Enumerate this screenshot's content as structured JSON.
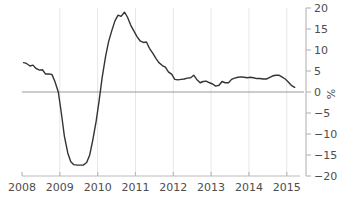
{
  "chart_data": {
    "type": "line",
    "title": "",
    "subtitle": "",
    "xlabel": "",
    "ylabel": "%",
    "xlim": [
      2008.0,
      2015.35
    ],
    "ylim": [
      -20,
      20
    ],
    "grid": "vertical-yearly",
    "legend": "none",
    "zero_line": true,
    "y_ticks": [
      20,
      15,
      10,
      5,
      0,
      -5,
      -10,
      -15,
      -20
    ],
    "y_tick_labels": [
      "20",
      "15",
      "10",
      "5",
      "0",
      "−5",
      "−10",
      "−15",
      "−20"
    ],
    "y_axis_position": "right",
    "x_ticks": [
      2008,
      2009,
      2010,
      2011,
      2012,
      2013,
      2014,
      2015
    ],
    "x_tick_labels": [
      "2008",
      "2009",
      "2010",
      "2011",
      "2012",
      "2013",
      "2014",
      "2015"
    ],
    "series": [
      {
        "name": "growth-rate",
        "color": "#333333",
        "x": [
          2008.04,
          2008.12,
          2008.21,
          2008.29,
          2008.37,
          2008.46,
          2008.54,
          2008.62,
          2008.71,
          2008.79,
          2008.87,
          2008.96,
          2009.04,
          2009.12,
          2009.21,
          2009.29,
          2009.37,
          2009.46,
          2009.54,
          2009.62,
          2009.71,
          2009.79,
          2009.87,
          2009.96,
          2010.04,
          2010.12,
          2010.21,
          2010.29,
          2010.37,
          2010.46,
          2010.54,
          2010.62,
          2010.71,
          2010.79,
          2010.87,
          2010.96,
          2011.04,
          2011.12,
          2011.21,
          2011.29,
          2011.37,
          2011.46,
          2011.54,
          2011.62,
          2011.71,
          2011.79,
          2011.87,
          2011.96,
          2012.04,
          2012.12,
          2012.21,
          2012.29,
          2012.37,
          2012.46,
          2012.54,
          2012.62,
          2012.71,
          2012.79,
          2012.87,
          2012.96,
          2013.04,
          2013.12,
          2013.21,
          2013.29,
          2013.37,
          2013.46,
          2013.54,
          2013.62,
          2013.71,
          2013.79,
          2013.87,
          2013.96,
          2014.04,
          2014.12,
          2014.21,
          2014.29,
          2014.37,
          2014.46,
          2014.54,
          2014.62,
          2014.71,
          2014.79,
          2014.87,
          2014.96,
          2015.04,
          2015.12,
          2015.21
        ],
        "values": [
          7.0,
          6.8,
          6.2,
          6.4,
          5.6,
          5.2,
          5.3,
          4.3,
          4.3,
          4.2,
          2.5,
          0.0,
          -5.0,
          -10.5,
          -14.5,
          -16.6,
          -17.3,
          -17.4,
          -17.4,
          -17.4,
          -16.8,
          -15.0,
          -11.5,
          -7.0,
          -2.0,
          3.5,
          8.5,
          12.0,
          14.5,
          17.0,
          18.3,
          18.0,
          19.0,
          17.8,
          16.0,
          14.5,
          13.2,
          12.2,
          11.8,
          11.9,
          10.4,
          9.2,
          8.0,
          7.0,
          6.3,
          5.9,
          4.8,
          4.2,
          3.0,
          2.9,
          3.0,
          3.1,
          3.3,
          3.4,
          4.0,
          3.0,
          2.2,
          2.5,
          2.6,
          2.2,
          1.9,
          1.4,
          1.6,
          2.5,
          2.2,
          2.2,
          3.0,
          3.3,
          3.5,
          3.6,
          3.5,
          3.4,
          3.5,
          3.4,
          3.2,
          3.2,
          3.1,
          3.1,
          3.4,
          3.8,
          4.0,
          4.0,
          3.6,
          3.1,
          2.4,
          1.6,
          1.1
        ]
      }
    ]
  },
  "axis": {
    "unit_label": "%"
  }
}
